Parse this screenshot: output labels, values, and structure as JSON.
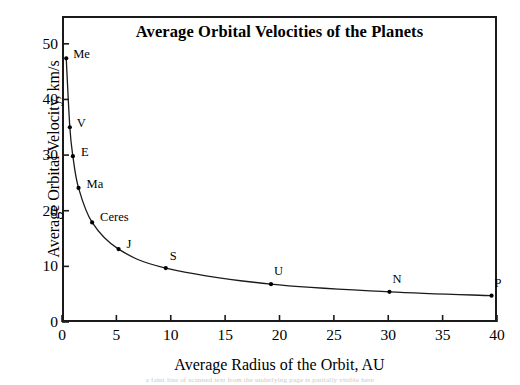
{
  "chart_data": {
    "type": "scatter",
    "title": "Average Orbital Velocities of the Planets",
    "xlabel": "Average Radius of the Orbit, AU",
    "ylabel": "Average Orbital Velocity, km/s",
    "xlim": [
      0,
      40
    ],
    "ylim": [
      0,
      55
    ],
    "grid": false,
    "legend": "none",
    "x_ticks": [
      "0",
      "5",
      "10",
      "15",
      "20",
      "25",
      "30",
      "35",
      "40"
    ],
    "x_tick_values": [
      0,
      5,
      10,
      15,
      20,
      25,
      30,
      35,
      40
    ],
    "y_ticks": [
      "0",
      "10",
      "20",
      "30",
      "40",
      "50"
    ],
    "y_tick_values": [
      0,
      10,
      20,
      30,
      40,
      50
    ],
    "points": [
      {
        "label": "Me",
        "x": 0.39,
        "y": 47.4,
        "label_dx": 7,
        "label_dy": -4
      },
      {
        "label": "V",
        "x": 0.72,
        "y": 35.0,
        "label_dx": 7,
        "label_dy": -4
      },
      {
        "label": "E",
        "x": 1.0,
        "y": 29.8,
        "label_dx": 8,
        "label_dy": -4
      },
      {
        "label": "Ma",
        "x": 1.52,
        "y": 24.1,
        "label_dx": 8,
        "label_dy": -4
      },
      {
        "label": "Ceres",
        "x": 2.77,
        "y": 17.9,
        "label_dx": 8,
        "label_dy": -5
      },
      {
        "label": "J",
        "x": 5.2,
        "y": 13.1,
        "label_dx": 8,
        "label_dy": -5
      },
      {
        "label": "S",
        "x": 9.54,
        "y": 9.7,
        "label_dx": 4,
        "label_dy": -12
      },
      {
        "label": "U",
        "x": 19.22,
        "y": 6.8,
        "label_dx": 3,
        "label_dy": -13
      },
      {
        "label": "N",
        "x": 30.11,
        "y": 5.43,
        "label_dx": 3,
        "label_dy": -13
      },
      {
        "label": "P",
        "x": 39.5,
        "y": 4.74,
        "label_dx": 3,
        "label_dy": -13
      }
    ],
    "curve_color": "#1a1a1a",
    "marker_color": "#000000",
    "frame_color": "#1a1a1a",
    "background_color": "#ffffff"
  },
  "artifact": {
    "scan_text": "a faint line of scanned text from the underlying page is partially visible here"
  }
}
